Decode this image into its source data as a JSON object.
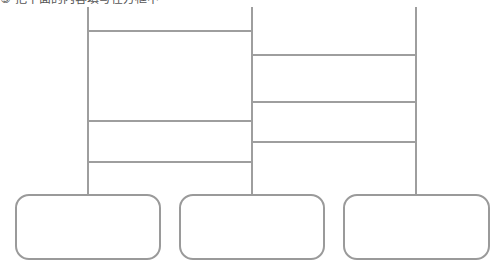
{
  "caption": "③ 把下面的内容填写在方框中",
  "diagram": {
    "type": "ladder-lottery (amidakuji)",
    "line_color": "#9e9e9e",
    "verticals": [
      {
        "id": "left",
        "x": 87
      },
      {
        "id": "middle",
        "x": 251
      },
      {
        "id": "right",
        "x": 415
      }
    ],
    "rungs": [
      {
        "between": [
          "left",
          "middle"
        ],
        "y": 31
      },
      {
        "between": [
          "left",
          "middle"
        ],
        "y": 121
      },
      {
        "between": [
          "left",
          "middle"
        ],
        "y": 162
      },
      {
        "between": [
          "middle",
          "right"
        ],
        "y": 54
      },
      {
        "between": [
          "middle",
          "right"
        ],
        "y": 101
      },
      {
        "between": [
          "middle",
          "right"
        ],
        "y": 141
      }
    ],
    "boxes": [
      {
        "id": "box-1",
        "label": ""
      },
      {
        "id": "box-2",
        "label": ""
      },
      {
        "id": "box-3",
        "label": ""
      }
    ]
  }
}
